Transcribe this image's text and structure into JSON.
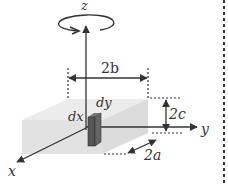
{
  "diagram": {
    "axes": {
      "z_label": "z",
      "y_label": "y",
      "x_label": "x"
    },
    "dimensions": {
      "width_label": "2b",
      "height_label": "2c",
      "depth_label": "2a"
    },
    "element": {
      "dx_label": "dx",
      "dy_label": "dy"
    },
    "rotation_indicator": "rotation-about-z",
    "colors": {
      "box_fill": "#e4e4e4",
      "box_top": "#ececec",
      "element_fill": "#555555",
      "line": "#333333"
    }
  }
}
